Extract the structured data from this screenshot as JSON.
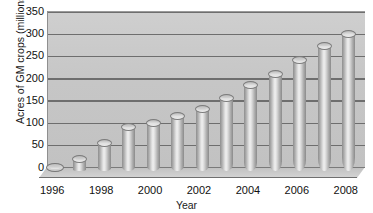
{
  "chart_data": {
    "type": "bar",
    "title": "",
    "subtitle": "",
    "xlabel": "Year",
    "ylabel": "Acres of GM crops (millions)",
    "categories": [
      "1996",
      "1997",
      "1998",
      "1999",
      "2000",
      "2001",
      "2002",
      "2003",
      "2004",
      "2005",
      "2006",
      "2007",
      "2008"
    ],
    "values": [
      3,
      17,
      55,
      90,
      100,
      115,
      130,
      155,
      185,
      210,
      240,
      272,
      300
    ],
    "series": [
      {
        "name": "Acres of GM crops (millions)",
        "values": [
          3,
          17,
          55,
          90,
          100,
          115,
          130,
          155,
          185,
          210,
          240,
          272,
          300
        ]
      }
    ],
    "ylim": [
      0,
      350
    ],
    "y_ticks": [
      0,
      50,
      100,
      150,
      200,
      250,
      300,
      350
    ],
    "y_tick_labels": [
      "0",
      "50",
      "100",
      "150",
      "200",
      "250",
      "300",
      "350"
    ],
    "x_tick_labels": [
      "1996",
      "1998",
      "2000",
      "2002",
      "2004",
      "2006",
      "2008"
    ],
    "grid": true,
    "grid_axis": "y",
    "legend": false,
    "legend_position": "none",
    "bar_style": "3d-cylinder",
    "colors": {
      "plot_background": "#c8c8c8",
      "gridline": "#6e6e6e",
      "bar_light": "#f0f0f0",
      "bar_mid": "#c0c0c0",
      "bar_dark": "#8a8a8a",
      "text": "#111111",
      "page_background": "#ffffff"
    }
  }
}
